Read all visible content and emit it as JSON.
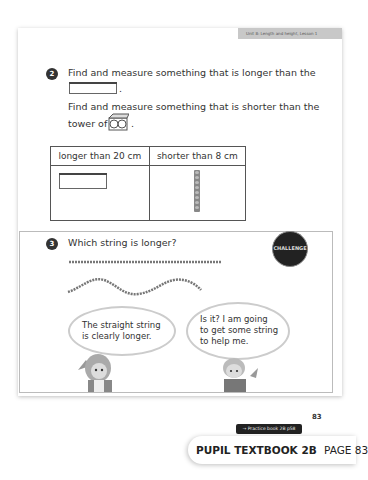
{
  "header": {
    "unit_tab": "Unit 8: Length and height, Lesson 1"
  },
  "question2": {
    "number": "2",
    "line1": "Find and measure something that is longer than the",
    "line1_end": ".",
    "line2": "Find and measure something that is shorter than the",
    "line3": "tower of",
    "line3_end": ".",
    "icons": [
      "pencil-case-icon",
      "cube-tower-icon"
    ],
    "table": {
      "headers": [
        "longer than 20 cm",
        "shorter than 8 cm"
      ],
      "cells": [
        "pencil-case-image",
        "cube-tower-image"
      ]
    }
  },
  "question3": {
    "number": "3",
    "prompt": "Which string is longer?",
    "badge": "CHALLENGE",
    "bubble_left": "The straight string is clearly longer.",
    "bubble_left_lines": [
      "The straight string",
      "is clearly longer."
    ],
    "bubble_right": "Is it? I am going to get some string to help me.",
    "bubble_right_lines": [
      "Is it? I am going",
      "to get some string",
      "to help me."
    ]
  },
  "footer": {
    "practice_link": "→ Practice book 2B p58",
    "page_number": "83",
    "book_title": "PUPIL TEXTBOOK 2B",
    "book_page": "PAGE 83"
  },
  "colors": {
    "tab_bg": "#c8c8c8",
    "badge_bg": "#222222",
    "practice_bg": "#222222"
  }
}
